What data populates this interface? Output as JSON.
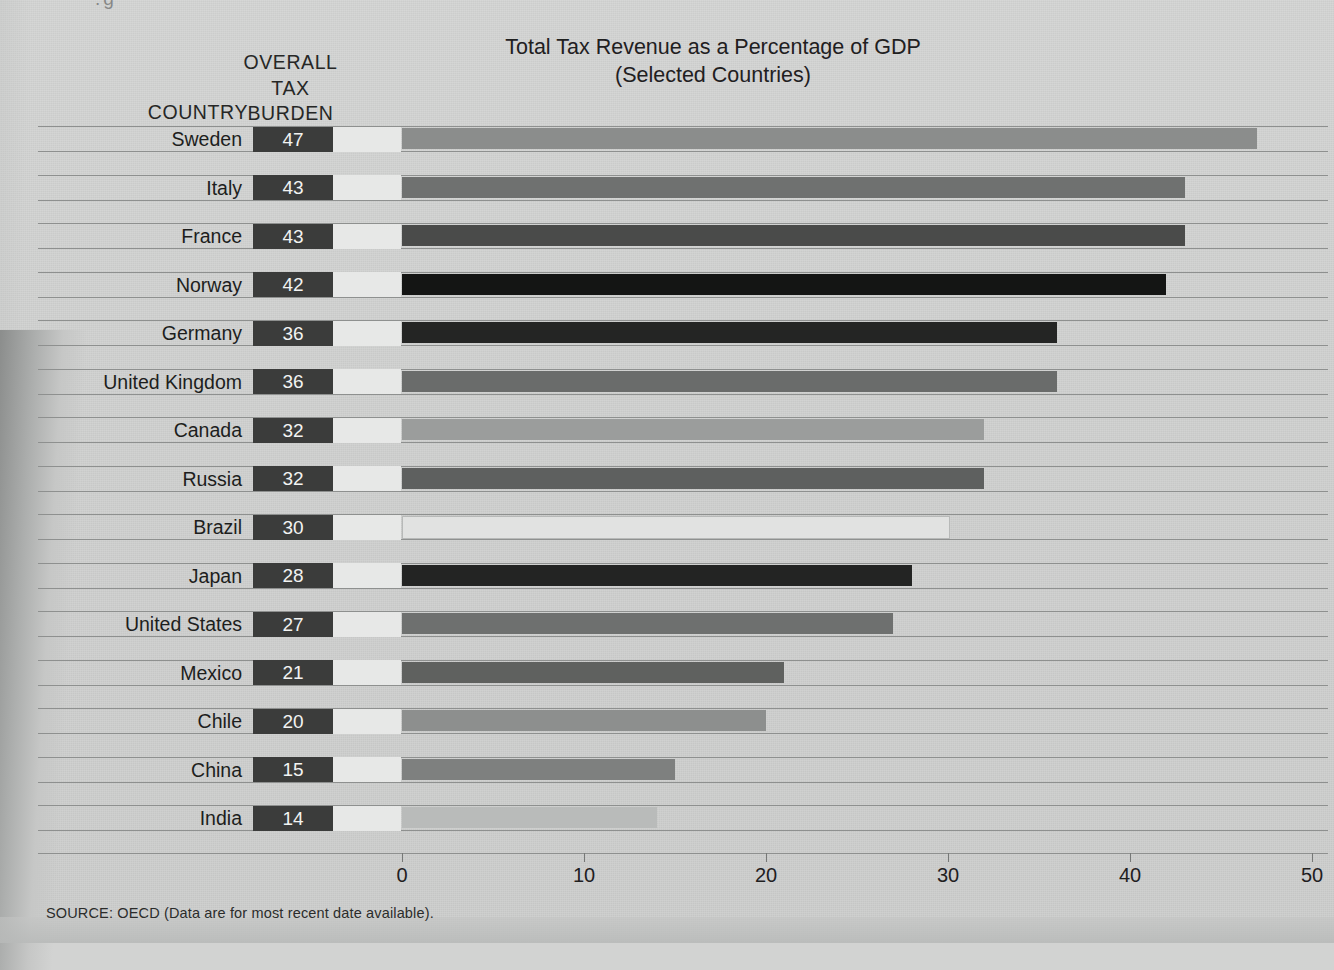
{
  "header": {
    "country_label": "COUNTRY",
    "burden_label_lines": [
      "OVERALL",
      "TAX",
      "BURDEN"
    ],
    "burden_line1": "OVERALL",
    "burden_line2": "TAX",
    "burden_line3": "BURDEN"
  },
  "title_line1": "Total Tax Revenue as a Percentage of GDP",
  "title_line2": "(Selected Countries)",
  "source": "SOURCE: OECD (Data are for most recent date available).",
  "colors": {
    "page_background": "#d2d3d2",
    "rule": "#8e908f",
    "value_box_fill": "#3b3c3b",
    "value_box_text": "#f2f3f2",
    "spacer_box_fill": "#e7e8e7",
    "text": "#1d1e1d"
  },
  "chart_data": {
    "type": "bar",
    "orientation": "horizontal",
    "title": "Total Tax Revenue as a Percentage of GDP (Selected Countries)",
    "xlabel": "",
    "ylabel": "COUNTRY",
    "value_column_header": "OVERALL TAX BURDEN",
    "xlim": [
      0,
      50
    ],
    "xticks": [
      0,
      10,
      20,
      30,
      40,
      50
    ],
    "xtick_labels": [
      "0",
      "10",
      "20",
      "30",
      "40",
      "50"
    ],
    "grid": false,
    "legend": null,
    "units": "percent of GDP",
    "categories": [
      "Sweden",
      "Italy",
      "France",
      "Norway",
      "Germany",
      "United Kingdom",
      "Canada",
      "Russia",
      "Brazil",
      "Japan",
      "United States",
      "Mexico",
      "Chile",
      "China",
      "India"
    ],
    "values": [
      47,
      43,
      43,
      42,
      36,
      36,
      32,
      32,
      30,
      28,
      27,
      21,
      20,
      15,
      14
    ],
    "bars": [
      {
        "country": "Sweden",
        "value": 47,
        "label": "47",
        "color": "#8b8d8c"
      },
      {
        "country": "Italy",
        "value": 43,
        "label": "43",
        "color": "#6f7170"
      },
      {
        "country": "France",
        "value": 43,
        "label": "43",
        "color": "#4a4b4a"
      },
      {
        "country": "Norway",
        "value": 42,
        "label": "42",
        "color": "#141514"
      },
      {
        "country": "Germany",
        "value": 36,
        "label": "36",
        "color": "#242524"
      },
      {
        "country": "United Kingdom",
        "value": 36,
        "label": "36",
        "color": "#6a6c6b"
      },
      {
        "country": "Canada",
        "value": 32,
        "label": "32",
        "color": "#9b9d9c"
      },
      {
        "country": "Russia",
        "value": 32,
        "label": "32",
        "color": "#5e605f"
      },
      {
        "country": "Brazil",
        "value": 30,
        "label": "30",
        "color": "#e1e2e1"
      },
      {
        "country": "Japan",
        "value": 28,
        "label": "28",
        "color": "#232423"
      },
      {
        "country": "United States",
        "value": 27,
        "label": "27",
        "color": "#6e706f"
      },
      {
        "country": "Mexico",
        "value": 21,
        "label": "21",
        "color": "#5f615f"
      },
      {
        "country": "Chile",
        "value": 20,
        "label": "20",
        "color": "#8d8f8e"
      },
      {
        "country": "China",
        "value": 15,
        "label": "15",
        "color": "#7e807f"
      },
      {
        "country": "India",
        "value": 14,
        "label": "14",
        "color": "#b9bbba"
      }
    ]
  }
}
